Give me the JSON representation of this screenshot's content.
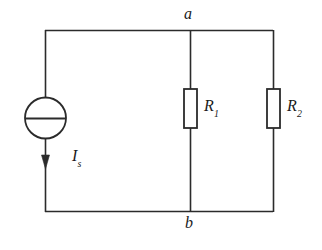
{
  "diagram": {
    "background_color": "#ffffff",
    "line_color": "#2b2b2b",
    "labels": {
      "node_a": "a",
      "node_b": "b",
      "source_symbol": "I",
      "source_subscript": "s",
      "resistor1_symbol": "R",
      "resistor1_subscript": "1",
      "resistor2_symbol": "R",
      "resistor2_subscript": "2"
    },
    "components": [
      {
        "name": "current-source",
        "type": "independent-current-source",
        "label": "I_s",
        "shape": "circle-with-horizontal-bar",
        "arrow_direction": "down",
        "branch": "left"
      },
      {
        "name": "resistor-1",
        "type": "resistor",
        "label": "R_1",
        "shape": "vertical-rectangle",
        "branch": "middle"
      },
      {
        "name": "resistor-2",
        "type": "resistor",
        "label": "R_2",
        "shape": "vertical-rectangle",
        "branch": "right"
      }
    ],
    "nodes": [
      {
        "name": "node-a",
        "label": "a",
        "position": "top"
      },
      {
        "name": "node-b",
        "label": "b",
        "position": "bottom"
      }
    ]
  }
}
